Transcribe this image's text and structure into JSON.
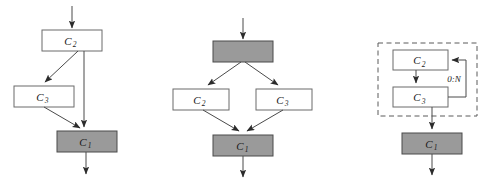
{
  "figure": {
    "background_color": "#ffffff",
    "filled_box_color": "#9a9a9a",
    "open_box_color": "#ffffff",
    "stroke_color": "#4a4a4a",
    "dashed_stroke_color": "#5a5a5a"
  },
  "diagrams": [
    {
      "id": "diagram-sequence-skip",
      "nodes": [
        {
          "id": "d1-c2",
          "base": "C",
          "sub": "2",
          "style": "open",
          "x": 42,
          "y": 30,
          "w": 60,
          "h": 21
        },
        {
          "id": "d1-c3",
          "base": "C",
          "sub": "3",
          "style": "open",
          "x": 14,
          "y": 86,
          "w": 60,
          "h": 21
        },
        {
          "id": "d1-c1",
          "base": "C",
          "sub": "1",
          "style": "filled",
          "x": 57,
          "y": 131,
          "w": 60,
          "h": 21
        }
      ],
      "edges": [
        {
          "id": "d1-in",
          "label": ""
        },
        {
          "id": "d1-c2-c3",
          "label": ""
        },
        {
          "id": "d1-c2-c1",
          "label": ""
        },
        {
          "id": "d1-c3-c1",
          "label": ""
        },
        {
          "id": "d1-out",
          "label": ""
        }
      ]
    },
    {
      "id": "diagram-parallel-branch",
      "nodes": [
        {
          "id": "d2-top",
          "base": "",
          "sub": "",
          "style": "filled",
          "x": 213,
          "y": 41,
          "w": 60,
          "h": 21
        },
        {
          "id": "d2-c2",
          "base": "C",
          "sub": "2",
          "style": "open",
          "x": 173,
          "y": 89,
          "w": 56,
          "h": 21
        },
        {
          "id": "d2-c3",
          "base": "C",
          "sub": "3",
          "style": "open",
          "x": 256,
          "y": 89,
          "w": 56,
          "h": 21
        },
        {
          "id": "d2-c1",
          "base": "C",
          "sub": "1",
          "style": "filled",
          "x": 213,
          "y": 135,
          "w": 60,
          "h": 21
        }
      ],
      "edges": [
        {
          "id": "d2-in",
          "label": ""
        },
        {
          "id": "d2-top-c2",
          "label": ""
        },
        {
          "id": "d2-top-c3",
          "label": ""
        },
        {
          "id": "d2-c2-c1",
          "label": ""
        },
        {
          "id": "d2-c3-c1",
          "label": ""
        },
        {
          "id": "d2-out",
          "label": ""
        }
      ]
    },
    {
      "id": "diagram-loop-group",
      "group": {
        "id": "d3-loop-group",
        "x": 378,
        "y": 43,
        "w": 99,
        "h": 73
      },
      "nodes": [
        {
          "id": "d3-c2",
          "base": "C",
          "sub": "2",
          "style": "open",
          "x": 393,
          "y": 50,
          "w": 55,
          "h": 20
        },
        {
          "id": "d3-c3",
          "base": "C",
          "sub": "3",
          "style": "open",
          "x": 393,
          "y": 87,
          "w": 55,
          "h": 20
        },
        {
          "id": "d3-c1",
          "base": "C",
          "sub": "1",
          "style": "filled",
          "x": 402,
          "y": 133,
          "w": 60,
          "h": 21
        }
      ],
      "edges": [
        {
          "id": "d3-c2-c3",
          "label": ""
        },
        {
          "id": "d3-loop",
          "label": "0:N"
        },
        {
          "id": "d3-out-c1",
          "label": ""
        },
        {
          "id": "d3-out",
          "label": ""
        }
      ]
    }
  ]
}
